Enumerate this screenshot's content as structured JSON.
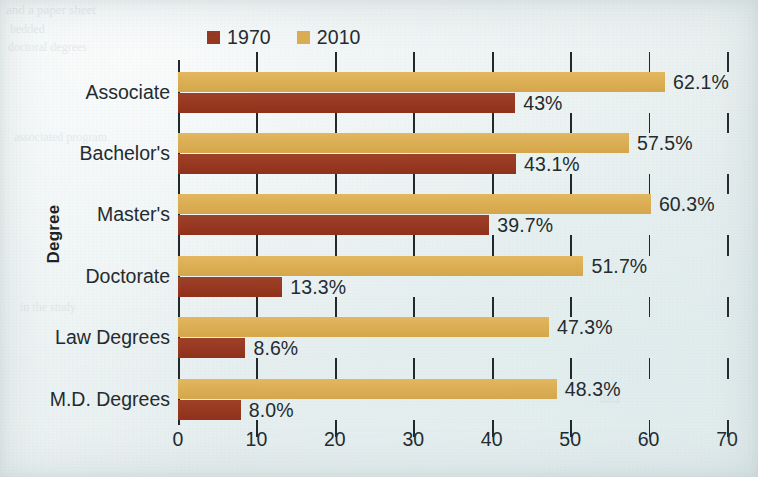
{
  "chart_data": {
    "type": "bar",
    "orientation": "horizontal",
    "title": "",
    "xlabel": "",
    "ylabel": "Degree",
    "xlim": [
      0,
      70
    ],
    "xticks": [
      0,
      10,
      20,
      30,
      40,
      50,
      60,
      70
    ],
    "grid": true,
    "grid_axis": "x",
    "legend_position": "top-left",
    "categories": [
      "Associate",
      "Bachelor's",
      "Master's",
      "Doctorate",
      "Law Degrees",
      "M.D. Degrees"
    ],
    "series": [
      {
        "name": "1970",
        "color": "#97371f",
        "values": [
          43,
          43.1,
          39.7,
          13.3,
          8.6,
          8.0
        ],
        "labels": [
          "43%",
          "43.1%",
          "39.7%",
          "13.3%",
          "8.6%",
          "8.0%"
        ]
      },
      {
        "name": "2010",
        "color": "#dcae52",
        "values": [
          62.1,
          57.5,
          60.3,
          51.7,
          47.3,
          48.3
        ],
        "labels": [
          "62.1%",
          "57.5%",
          "60.3%",
          "51.7%",
          "47.3%",
          "48.3%"
        ]
      }
    ]
  },
  "legend": {
    "items": [
      {
        "label": "1970",
        "color": "#97371f"
      },
      {
        "label": "2010",
        "color": "#dcae52"
      }
    ]
  },
  "axis": {
    "y_title": "Degree",
    "x_tick_labels": [
      "0",
      "10",
      "20",
      "30",
      "40",
      "50",
      "60",
      "70"
    ]
  },
  "background": {
    "page_color": "#eaf1f1",
    "bleed_lines": [
      {
        "text": "and a paper sheet",
        "x": 6,
        "y": 2,
        "size": 13
      },
      {
        "text": "bedded",
        "x": 10,
        "y": 22,
        "size": 12
      },
      {
        "text": "doctoral degrees",
        "x": 8,
        "y": 40,
        "size": 12
      },
      {
        "text": "associated program",
        "x": 14,
        "y": 130,
        "size": 12
      },
      {
        "text": "in the study",
        "x": 20,
        "y": 300,
        "size": 12
      },
      {
        "text": "in an area",
        "x": 660,
        "y": 200,
        "size": 12
      },
      {
        "text": "data",
        "x": 600,
        "y": 392,
        "size": 12
      }
    ]
  }
}
